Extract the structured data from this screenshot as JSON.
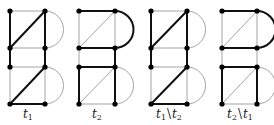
{
  "colors": {
    "thick": "#111111",
    "thin": "#9a9a9a",
    "node": "#000000",
    "background": "#ffffff"
  },
  "layout": {
    "rows_y": [
      11,
      48,
      67,
      104
    ],
    "node_radius": 2.6,
    "thick_width": 2.0,
    "thin_width": 0.9
  },
  "graphs": [
    {
      "id": "t1",
      "label": {
        "base": "t",
        "sub": "1",
        "op": "",
        "base2": "",
        "sub2": ""
      },
      "left_x": 10,
      "right_x": 45,
      "edges": {
        "top_h": "thin",
        "upper_left_v": "thick",
        "upper_right_v": "thick",
        "upper_diag": "thick",
        "upper_arc": "thin",
        "mid_h_upper": "thin",
        "link_left_v": "thick",
        "link_right_v": "thick",
        "mid_h_lower": "thin",
        "lower_left_v": "thin",
        "lower_right_v": "thin",
        "lower_diag": "thick",
        "lower_arc": "thin",
        "bottom_h": "thick"
      }
    },
    {
      "id": "t2",
      "label": {
        "base": "t",
        "sub": "2",
        "op": "",
        "base2": "",
        "sub2": ""
      },
      "left_x": 79,
      "right_x": 115,
      "edges": {
        "top_h": "thick",
        "upper_left_v": "thin",
        "upper_right_v": "thin",
        "upper_diag": "thin",
        "upper_arc": "thick",
        "mid_h_upper": "thick",
        "link_left_v": "thin",
        "link_right_v": "thick",
        "mid_h_lower": "thick",
        "lower_left_v": "thick",
        "lower_right_v": "thick",
        "lower_diag": "thin",
        "lower_arc": "thin",
        "bottom_h": "thin"
      }
    },
    {
      "id": "t1-minus-t2",
      "label": {
        "base": "t",
        "sub": "1",
        "op": "\\",
        "base2": "t",
        "sub2": "2"
      },
      "left_x": 151,
      "right_x": 187,
      "edges": {
        "top_h": "thin",
        "upper_left_v": "thick",
        "upper_right_v": "thick",
        "upper_diag": "thick",
        "upper_arc": "thin",
        "mid_h_upper": "thin",
        "link_left_v": "thick",
        "link_right_v": "thick",
        "mid_h_lower": "thin",
        "lower_left_v": "thin",
        "lower_right_v": "thin",
        "lower_diag": "thick",
        "lower_arc": "thin",
        "bottom_h": "thick"
      }
    },
    {
      "id": "t2-minus-t1",
      "label": {
        "base": "t",
        "sub": "2",
        "op": "\\",
        "base2": "t",
        "sub2": "1"
      },
      "left_x": 222,
      "right_x": 257,
      "edges": {
        "top_h": "thick",
        "upper_left_v": "thin",
        "upper_right_v": "thin",
        "upper_diag": "thin",
        "upper_arc": "thick",
        "mid_h_upper": "thick",
        "link_left_v": "thin",
        "link_right_v": "thin",
        "mid_h_lower": "thick",
        "lower_left_v": "thick",
        "lower_right_v": "thick",
        "lower_diag": "thin",
        "lower_arc": "thin",
        "bottom_h": "thin"
      }
    }
  ]
}
